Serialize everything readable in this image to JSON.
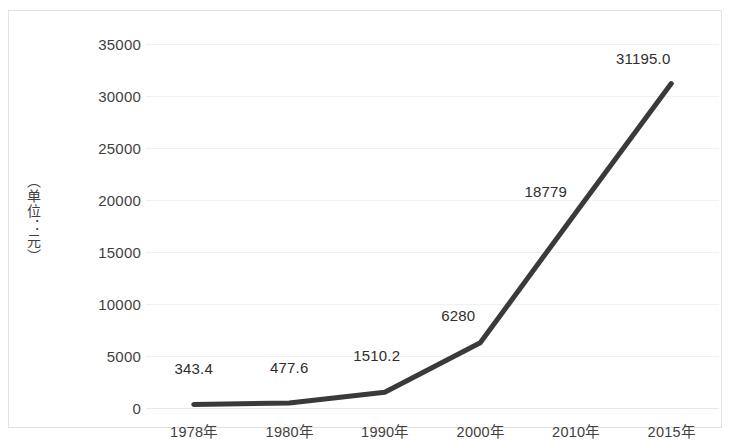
{
  "chart_data": {
    "type": "line",
    "title": "",
    "xlabel": "",
    "ylabel": "（单位：元）",
    "categories": [
      "1978年",
      "1980年",
      "1990年",
      "2000年",
      "2010年",
      "2015年"
    ],
    "values": [
      343.4,
      477.6,
      1510.2,
      6280,
      18779,
      31195.0
    ],
    "point_labels": [
      "343.4",
      "477.6",
      "1510.2",
      "6280",
      "18779",
      "31195.0"
    ],
    "ylim": [
      0,
      35000
    ],
    "ytick_labels": [
      "0",
      "5000",
      "10000",
      "15000",
      "20000",
      "25000",
      "30000",
      "35000"
    ],
    "ytick_values": [
      0,
      5000,
      10000,
      15000,
      20000,
      25000,
      30000,
      35000
    ],
    "grid": true,
    "legend": "none",
    "series": [
      {
        "name": "",
        "values": [
          343.4,
          477.6,
          1510.2,
          6280,
          18779,
          31195.0
        ],
        "color": "#3a3a3a"
      }
    ]
  },
  "style": {
    "line_color": "#3a3a3a",
    "grid_color": "#f0f0f0",
    "text_color": "#3f3f3f",
    "border_color": "#e2e2e2",
    "background": "#ffffff"
  }
}
